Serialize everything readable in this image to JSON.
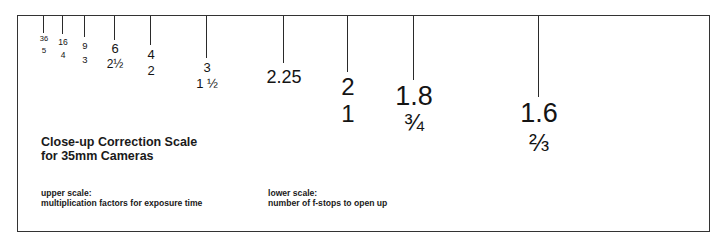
{
  "title": {
    "line1": "Close-up Correction Scale",
    "line2": "for 35mm Cameras"
  },
  "notes": {
    "upper_heading": "upper scale:",
    "upper_text": "multiplication factors for exposure time",
    "lower_heading": "lower scale:",
    "lower_text": "number of f-stops to open up"
  },
  "scale": [
    {
      "upper": "36",
      "lower": "5",
      "x": 43,
      "tick_end": 33,
      "upper_top": 35,
      "lower_top": 47,
      "upper_size": 7.5,
      "lower_size": 8
    },
    {
      "upper": "16",
      "lower": "4",
      "x": 62,
      "tick_end": 34,
      "upper_top": 38,
      "lower_top": 51,
      "upper_size": 8.5,
      "lower_size": 8.5
    },
    {
      "upper": "9",
      "lower": "3",
      "x": 84,
      "tick_end": 37,
      "upper_top": 41,
      "lower_top": 55,
      "upper_size": 9.5,
      "lower_size": 9.5
    },
    {
      "upper": "6",
      "lower": "2½",
      "x": 114,
      "tick_end": 40,
      "upper_top": 42,
      "lower_top": 58,
      "upper_size": 13,
      "lower_size": 12
    },
    {
      "upper": "4",
      "lower": "2",
      "x": 150,
      "tick_end": 45,
      "upper_top": 48,
      "lower_top": 64,
      "upper_size": 13,
      "lower_size": 13
    },
    {
      "upper": "3",
      "lower": "1 ½",
      "x": 206,
      "tick_end": 58,
      "upper_top": 61,
      "lower_top": 77,
      "upper_size": 13,
      "lower_size": 13
    },
    {
      "upper": "2.25",
      "lower": "",
      "x": 283,
      "tick_end": 63,
      "upper_top": 68,
      "lower_top": 0,
      "upper_size": 18,
      "lower_size": 0
    },
    {
      "upper": "2",
      "lower": "1",
      "x": 347,
      "tick_end": 72,
      "upper_top": 75,
      "lower_top": 102,
      "upper_size": 24,
      "lower_size": 24
    },
    {
      "upper": "1.8",
      "lower": "¾",
      "x": 413,
      "tick_end": 80,
      "upper_top": 83,
      "lower_top": 111,
      "upper_size": 27,
      "lower_size": 24
    },
    {
      "upper": "1.6",
      "lower": "⅔",
      "x": 538,
      "tick_end": 97,
      "upper_top": 100,
      "lower_top": 131,
      "upper_size": 27,
      "lower_size": 24
    }
  ]
}
